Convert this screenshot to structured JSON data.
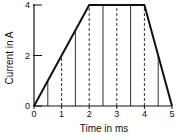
{
  "chart_data": {
    "type": "line",
    "title": "",
    "xlabel": "Time in ms",
    "ylabel": "Current in A",
    "x": [
      0,
      2,
      4,
      5
    ],
    "values": [
      0,
      4,
      4,
      0
    ],
    "xlim": [
      0,
      5
    ],
    "ylim": [
      0,
      4
    ],
    "xticks": [
      "0",
      "1",
      "2",
      "3",
      "4",
      "5"
    ],
    "yticks": [
      "0",
      "2",
      "4"
    ],
    "solid_verticals_at": [
      0.5,
      1.5,
      2.5,
      3.5,
      4.5
    ],
    "dashed_verticals_at": [
      1,
      2,
      3,
      4
    ],
    "grid": false
  }
}
